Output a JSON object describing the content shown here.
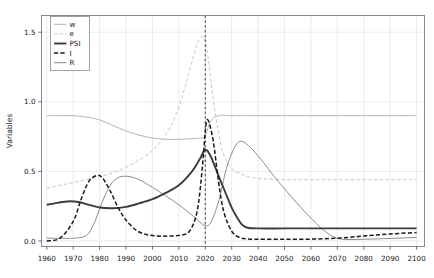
{
  "chart_data": {
    "type": "line",
    "title": "",
    "xlabel": "",
    "ylabel": "Variables",
    "xlim": [
      1958,
      2103
    ],
    "ylim": [
      -0.04,
      1.62
    ],
    "xticks": [
      1960,
      1970,
      1980,
      1990,
      2000,
      2010,
      2020,
      2030,
      2040,
      2050,
      2060,
      2070,
      2080,
      2090,
      2100
    ],
    "yticks": [
      0.0,
      0.5,
      1.0,
      1.5
    ],
    "ytick_labels": [
      "0.0",
      "0.5",
      "1.0",
      "1.5"
    ],
    "grid": true,
    "legend_position": "top-left",
    "annotations": [
      {
        "name": "vertical-reference-line",
        "type": "vline",
        "x": 2020,
        "style": "dashed",
        "color": "#303030"
      }
    ],
    "series": [
      {
        "name": "w",
        "label": "w",
        "color": "#b4b4b4",
        "style": "solid",
        "width": 1.0,
        "x": [
          1960,
          1965,
          1970,
          1975,
          1980,
          1985,
          1990,
          1995,
          2000,
          2005,
          2010,
          2015,
          2018,
          2020,
          2022,
          2025,
          2030,
          2040,
          2050,
          2060,
          2070,
          2080,
          2090,
          2100
        ],
        "values": [
          0.9,
          0.9,
          0.9,
          0.89,
          0.87,
          0.83,
          0.79,
          0.76,
          0.74,
          0.73,
          0.73,
          0.735,
          0.74,
          0.755,
          0.86,
          0.9,
          0.9,
          0.9,
          0.9,
          0.9,
          0.9,
          0.9,
          0.9,
          0.9
        ]
      },
      {
        "name": "e",
        "label": "e",
        "color": "#c6c6c6",
        "style": "dashed",
        "width": 1.0,
        "x": [
          1960,
          1965,
          1970,
          1975,
          1980,
          1985,
          1990,
          1995,
          2000,
          2005,
          2010,
          2014,
          2017,
          2019,
          2020,
          2021,
          2023,
          2025,
          2027,
          2030,
          2035,
          2040,
          2050,
          2060,
          2070,
          2080,
          2090,
          2100
        ],
        "values": [
          0.38,
          0.4,
          0.42,
          0.44,
          0.46,
          0.49,
          0.53,
          0.58,
          0.65,
          0.76,
          0.96,
          1.22,
          1.42,
          1.47,
          1.44,
          1.33,
          1.02,
          0.78,
          0.62,
          0.52,
          0.47,
          0.45,
          0.44,
          0.44,
          0.44,
          0.44,
          0.44,
          0.44
        ]
      },
      {
        "name": "PSI",
        "label": "PSI",
        "color": "#3c3c3c",
        "style": "solid",
        "width": 1.9,
        "x": [
          1960,
          1963,
          1966,
          1969,
          1972,
          1975,
          1980,
          1985,
          1990,
          1995,
          2000,
          2005,
          2010,
          2015,
          2018,
          2020,
          2022,
          2025,
          2028,
          2030,
          2032,
          2034,
          2036,
          2040,
          2050,
          2060,
          2070,
          2080,
          2090,
          2100
        ],
        "values": [
          0.26,
          0.27,
          0.28,
          0.285,
          0.28,
          0.265,
          0.24,
          0.235,
          0.245,
          0.27,
          0.3,
          0.345,
          0.4,
          0.5,
          0.59,
          0.655,
          0.61,
          0.47,
          0.33,
          0.24,
          0.17,
          0.115,
          0.095,
          0.09,
          0.09,
          0.09,
          0.09,
          0.09,
          0.09,
          0.09
        ]
      },
      {
        "name": "I",
        "label": "I",
        "color": "#1a1a1a",
        "style": "dashdot",
        "width": 1.5,
        "x": [
          1960,
          1965,
          1970,
          1973,
          1976,
          1979,
          1981,
          1984,
          1987,
          1990,
          1994,
          1998,
          2002,
          2006,
          2010,
          2014,
          2017,
          2019,
          2020,
          2021,
          2023,
          2025,
          2027,
          2030,
          2033,
          2036,
          2040,
          2050,
          2060,
          2070,
          2080,
          2090,
          2100
        ],
        "values": [
          0.0,
          0.02,
          0.14,
          0.3,
          0.43,
          0.47,
          0.455,
          0.36,
          0.24,
          0.15,
          0.075,
          0.045,
          0.035,
          0.035,
          0.04,
          0.07,
          0.22,
          0.55,
          0.79,
          0.87,
          0.72,
          0.43,
          0.21,
          0.07,
          0.025,
          0.015,
          0.012,
          0.012,
          0.013,
          0.02,
          0.035,
          0.05,
          0.06
        ]
      },
      {
        "name": "R",
        "label": "R",
        "color": "#8c8c8c",
        "style": "solid",
        "width": 1.0,
        "x": [
          1960,
          1970,
          1975,
          1978,
          1981,
          1984,
          1987,
          1990,
          1993,
          1996,
          2000,
          2005,
          2010,
          2015,
          2018,
          2020,
          2022,
          2025,
          2028,
          2031,
          2033,
          2035,
          2038,
          2042,
          2046,
          2050,
          2055,
          2060,
          2064,
          2068,
          2072,
          2080,
          2090,
          2100
        ],
        "values": [
          0.02,
          0.02,
          0.04,
          0.13,
          0.28,
          0.4,
          0.455,
          0.465,
          0.455,
          0.43,
          0.385,
          0.325,
          0.26,
          0.185,
          0.135,
          0.11,
          0.13,
          0.28,
          0.52,
          0.67,
          0.715,
          0.705,
          0.655,
          0.565,
          0.465,
          0.375,
          0.265,
          0.165,
          0.09,
          0.035,
          0.012,
          0.012,
          0.018,
          0.025
        ]
      }
    ]
  },
  "axes": {
    "ylabel": "Variables"
  }
}
